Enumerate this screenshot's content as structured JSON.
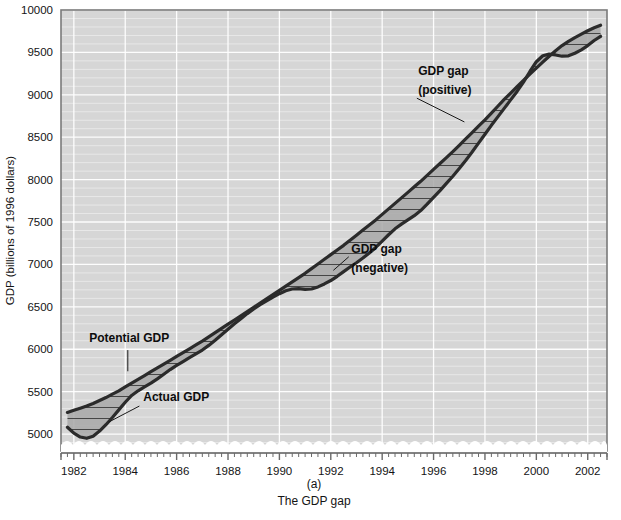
{
  "figure": {
    "caption_label": "(a)",
    "caption_title": "The GDP gap"
  },
  "chart_data": {
    "type": "line",
    "title": "The GDP gap",
    "subtitle": "(a)",
    "xlabel": "",
    "ylabel": "GDP (billions of 1996 dollars)",
    "xlim": [
      1981.5,
      2002.75
    ],
    "ylim": [
      4800,
      10000
    ],
    "yticks": [
      5000,
      5500,
      6000,
      6500,
      7000,
      7500,
      8000,
      8500,
      9000,
      9500,
      10000
    ],
    "ytick_labels": [
      "5000",
      "5500",
      "6000",
      "6500",
      "7000",
      "7500",
      "8000",
      "8500",
      "9000",
      "9500",
      "10000"
    ],
    "xticks": [
      1982,
      1984,
      1986,
      1988,
      1990,
      1992,
      1994,
      1996,
      1998,
      2000,
      2002
    ],
    "xtick_labels": [
      "1982",
      "1984",
      "1986",
      "1988",
      "1990",
      "1992",
      "1994",
      "1996",
      "1998",
      "2000",
      "2002"
    ],
    "x_minor_interval": 0.25,
    "y_minor_interval": 100,
    "grid": true,
    "grid_color": "#ffffff",
    "plot_background": "#d6d6d6",
    "axis_break": true,
    "legend": "none",
    "x": [
      1981.75,
      1982.0,
      1982.25,
      1982.5,
      1982.75,
      1983.0,
      1983.25,
      1983.5,
      1983.75,
      1984.0,
      1984.25,
      1984.5,
      1984.75,
      1985.0,
      1985.25,
      1985.5,
      1985.75,
      1986.0,
      1986.25,
      1986.5,
      1986.75,
      1987.0,
      1987.25,
      1987.5,
      1987.75,
      1988.0,
      1988.25,
      1988.5,
      1988.75,
      1989.0,
      1989.25,
      1989.5,
      1989.75,
      1990.0,
      1990.25,
      1990.5,
      1990.75,
      1991.0,
      1991.25,
      1991.5,
      1991.75,
      1992.0,
      1992.25,
      1992.5,
      1992.75,
      1993.0,
      1993.25,
      1993.5,
      1993.75,
      1994.0,
      1994.25,
      1994.5,
      1994.75,
      1995.0,
      1995.25,
      1995.5,
      1995.75,
      1996.0,
      1996.25,
      1996.5,
      1996.75,
      1997.0,
      1997.25,
      1997.5,
      1997.75,
      1998.0,
      1998.25,
      1998.5,
      1998.75,
      1999.0,
      1999.25,
      1999.5,
      1999.75,
      2000.0,
      2000.25,
      2000.5,
      2000.75,
      2001.0,
      2001.25,
      2001.5,
      2001.75,
      2002.0,
      2002.25,
      2002.5
    ],
    "series": [
      {
        "name": "Potential GDP",
        "color": "#2b2b2b",
        "values": [
          5255,
          5280,
          5305,
          5330,
          5360,
          5395,
          5430,
          5470,
          5510,
          5555,
          5600,
          5645,
          5690,
          5735,
          5780,
          5825,
          5870,
          5915,
          5960,
          6005,
          6050,
          6095,
          6145,
          6195,
          6245,
          6295,
          6345,
          6395,
          6445,
          6495,
          6545,
          6595,
          6645,
          6695,
          6745,
          6795,
          6845,
          6895,
          6950,
          7005,
          7060,
          7115,
          7170,
          7225,
          7285,
          7345,
          7405,
          7465,
          7525,
          7590,
          7655,
          7720,
          7785,
          7850,
          7915,
          7980,
          8050,
          8120,
          8190,
          8260,
          8330,
          8405,
          8480,
          8555,
          8630,
          8705,
          8785,
          8865,
          8945,
          9020,
          9095,
          9170,
          9245,
          9315,
          9385,
          9455,
          9520,
          9580,
          9630,
          9675,
          9715,
          9755,
          9790,
          9820
        ]
      },
      {
        "name": "Actual GDP",
        "color": "#2b2b2b",
        "values": [
          5080,
          5010,
          4965,
          4950,
          4975,
          5035,
          5110,
          5195,
          5285,
          5375,
          5455,
          5510,
          5555,
          5600,
          5650,
          5705,
          5760,
          5810,
          5855,
          5900,
          5945,
          5990,
          6045,
          6105,
          6170,
          6235,
          6300,
          6360,
          6420,
          6475,
          6525,
          6570,
          6615,
          6655,
          6690,
          6710,
          6715,
          6705,
          6710,
          6735,
          6770,
          6810,
          6860,
          6915,
          6970,
          7020,
          7075,
          7135,
          7200,
          7275,
          7350,
          7420,
          7475,
          7525,
          7575,
          7635,
          7710,
          7790,
          7870,
          7955,
          8040,
          8130,
          8225,
          8325,
          8430,
          8535,
          8640,
          8740,
          8840,
          8940,
          9040,
          9150,
          9275,
          9390,
          9460,
          9480,
          9470,
          9455,
          9460,
          9490,
          9530,
          9580,
          9640,
          9690
        ]
      }
    ],
    "annotations": [
      {
        "id": "potential-gdp",
        "text": "Potential GDP",
        "x": 1982.6,
        "y": 6080
      },
      {
        "id": "actual-gdp",
        "text": "Actual GDP",
        "x": 1984.7,
        "y": 5390
      },
      {
        "id": "gdp-gap-positive-line1",
        "text": "GDP gap",
        "x": 1995.4,
        "y": 9230
      },
      {
        "id": "gdp-gap-positive-line2",
        "text": "(positive)",
        "x": 1995.4,
        "y": 9010
      },
      {
        "id": "gdp-gap-negative-line1",
        "text": "GDP gap",
        "x": 1992.8,
        "y": 7130
      },
      {
        "id": "gdp-gap-negative-line2",
        "text": "(negative)",
        "x": 1992.8,
        "y": 6910
      }
    ],
    "gap_fill": {
      "color": "#a8a8a8",
      "hatch": "horizontal",
      "hatch_color": "#3a3a3a",
      "description": "Shaded region between Actual GDP and Potential GDP curves"
    }
  }
}
